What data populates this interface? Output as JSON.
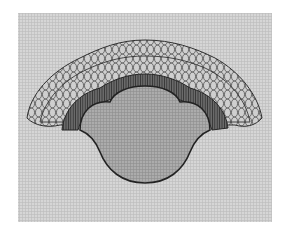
{
  "figure": {
    "colors": {
      "page_background": "#ffffff",
      "panel_background": "#d9d9d9",
      "texture_line": "#bdbdbd",
      "body_fill": "#a8a8a8",
      "inner_ring": "#4a4a4a",
      "petal_stroke": "#3a3a3a",
      "petal_fill": "#cfcfcf",
      "outline": "#222222"
    }
  }
}
